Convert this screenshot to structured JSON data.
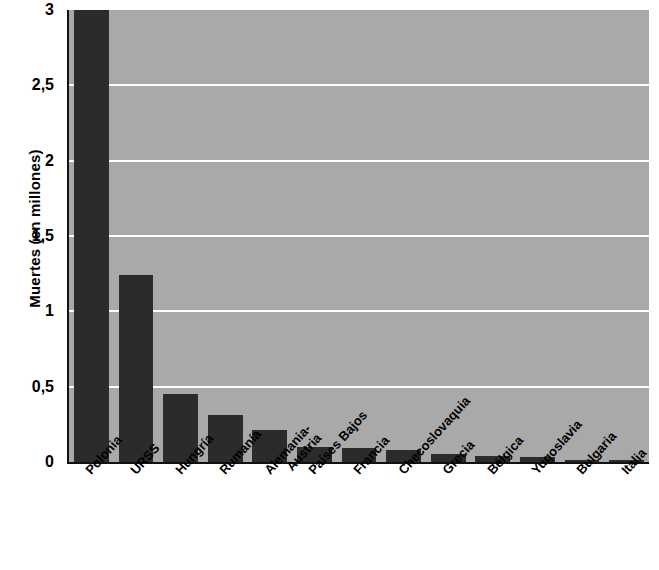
{
  "chart_data": {
    "type": "bar",
    "title": "",
    "subtitle": "",
    "xlabel": "",
    "ylabel": "Muertes (en millones)",
    "ylim": [
      0,
      3
    ],
    "ytick_labels": [
      "3",
      "2,5",
      "2",
      "1,5",
      "1",
      "0,5",
      "0"
    ],
    "ytick_values": [
      3,
      2.5,
      2,
      1.5,
      1,
      0.5,
      0
    ],
    "grid": true,
    "legend": false,
    "bar_clipped_note": "Polonia bar extends beyond the top of the axis (clipped at 3)",
    "categories": [
      "Polonia",
      "URSS",
      "Hungría",
      "Rumanía",
      "Alemania-Austria",
      "Países Bajos",
      "Francia",
      "Checoslovaquia",
      "Grecia",
      "Bélgica",
      "Yugoslavia",
      "Bulgaria",
      "Italia"
    ],
    "category_lines": [
      [
        "Polonia"
      ],
      [
        "URSS"
      ],
      [
        "Hungría"
      ],
      [
        "Rumanía"
      ],
      [
        "Alemania-",
        "Austria"
      ],
      [
        "Países Bajos"
      ],
      [
        "Francia"
      ],
      [
        "Checoslovaquia"
      ],
      [
        "Grecia"
      ],
      [
        "Bélgica"
      ],
      [
        "Yugoslavia"
      ],
      [
        "Bulgaria"
      ],
      [
        "Italia"
      ]
    ],
    "values": [
      3.0,
      1.24,
      0.45,
      0.31,
      0.21,
      0.1,
      0.09,
      0.08,
      0.055,
      0.04,
      0.03,
      0.015,
      0.008
    ],
    "colors": {
      "bar": "#2b2b2b",
      "plot_background": "#a9a9a9",
      "gridline": "#ffffff",
      "axis": "#111111",
      "text": "#000000",
      "page_background": "#ffffff"
    }
  }
}
